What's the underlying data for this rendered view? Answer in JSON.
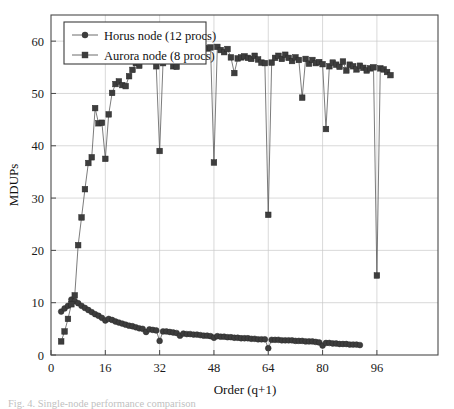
{
  "figure": {
    "caption": "Fig. 4.  Single-node performance comparison",
    "background": "#ffffff"
  },
  "chart_data": {
    "type": "scatter",
    "title": "",
    "xlabel": "Order (q+1)",
    "ylabel": "MDUPs",
    "xlim": [
      0,
      114
    ],
    "ylim": [
      0,
      65
    ],
    "xticks": [
      0,
      16,
      32,
      48,
      64,
      80,
      96
    ],
    "yticks": [
      0,
      10,
      20,
      30,
      40,
      50,
      60
    ],
    "grid": true,
    "legend_position": "top-left",
    "marker_color": "#3d3d3d",
    "line_color": "#5b5b5b",
    "series": [
      {
        "name": "Horus node (12 procs)",
        "marker": "circle",
        "x": [
          3,
          4,
          5,
          6,
          7,
          8,
          9,
          10,
          11,
          12,
          13,
          14,
          15,
          16,
          17,
          18,
          19,
          20,
          21,
          22,
          23,
          24,
          25,
          26,
          27,
          28,
          29,
          30,
          31,
          32,
          33,
          34,
          35,
          36,
          37,
          38,
          39,
          40,
          41,
          42,
          43,
          44,
          45,
          46,
          47,
          48,
          49,
          50,
          51,
          52,
          53,
          54,
          55,
          56,
          57,
          58,
          59,
          60,
          61,
          62,
          63,
          64,
          65,
          66,
          67,
          68,
          69,
          70,
          71,
          72,
          73,
          74,
          75,
          76,
          77,
          78,
          79,
          80,
          81,
          82,
          83,
          84,
          85,
          86,
          87,
          88,
          89,
          90,
          91
        ],
        "y": [
          8.3,
          8.9,
          9.4,
          10.6,
          10.3,
          9.9,
          9.4,
          9.0,
          8.6,
          8.2,
          7.8,
          7.5,
          7.1,
          6.6,
          6.9,
          6.7,
          6.4,
          6.2,
          6.0,
          5.8,
          5.6,
          5.5,
          5.3,
          5.1,
          5.0,
          4.4,
          4.9,
          4.8,
          4.7,
          2.7,
          4.5,
          4.5,
          4.4,
          4.3,
          4.2,
          3.7,
          4.1,
          4.0,
          4.0,
          3.9,
          3.9,
          3.8,
          3.7,
          3.7,
          3.6,
          3.3,
          3.6,
          3.5,
          3.5,
          3.4,
          3.4,
          3.3,
          3.3,
          3.2,
          3.2,
          3.2,
          3.1,
          3.1,
          3.0,
          3.0,
          3.0,
          1.3,
          2.9,
          2.9,
          2.9,
          2.8,
          2.8,
          2.8,
          2.8,
          2.7,
          2.7,
          2.7,
          2.6,
          2.6,
          2.6,
          2.5,
          2.4,
          1.8,
          2.3,
          2.3,
          2.2,
          2.2,
          2.1,
          2.1,
          2.1,
          2.0,
          2.0,
          2.0,
          1.9
        ]
      },
      {
        "name": "Aurora node (8 procs)",
        "marker": "square",
        "x": [
          3,
          4,
          5,
          6,
          7,
          8,
          9,
          10,
          11,
          12,
          13,
          14,
          15,
          16,
          17,
          18,
          19,
          20,
          21,
          22,
          23,
          24,
          25,
          26,
          27,
          28,
          29,
          30,
          31,
          32,
          33,
          34,
          35,
          36,
          37,
          38,
          39,
          40,
          41,
          42,
          43,
          44,
          45,
          46,
          47,
          48,
          49,
          50,
          51,
          52,
          53,
          54,
          55,
          56,
          57,
          58,
          59,
          60,
          61,
          62,
          63,
          64,
          65,
          66,
          67,
          68,
          69,
          70,
          71,
          72,
          73,
          74,
          75,
          76,
          77,
          78,
          79,
          80,
          81,
          82,
          83,
          84,
          85,
          86,
          87,
          88,
          89,
          90,
          91,
          92,
          93,
          94,
          95,
          96,
          97,
          98,
          99,
          100
        ],
        "y": [
          2.6,
          4.5,
          6.9,
          9.7,
          11.4,
          21.0,
          26.3,
          31.7,
          36.7,
          37.8,
          47.2,
          44.3,
          44.4,
          37.5,
          46.0,
          50.1,
          51.8,
          52.3,
          51.6,
          51.4,
          53.3,
          54.5,
          55.8,
          55.3,
          56.3,
          57.0,
          57.6,
          57.9,
          55.2,
          39.0,
          55.8,
          56.5,
          57.4,
          55.2,
          55.1,
          57.4,
          58.6,
          58.9,
          59.5,
          58.8,
          59.4,
          58.6,
          58.7,
          58.6,
          58.8,
          36.8,
          58.9,
          58.3,
          57.9,
          58.5,
          56.9,
          53.9,
          56.7,
          56.9,
          57.1,
          56.8,
          56.6,
          57.2,
          56.5,
          55.9,
          55.8,
          26.8,
          55.9,
          56.8,
          57.2,
          56.6,
          57.4,
          56.8,
          56.2,
          56.9,
          56.4,
          49.2,
          56.6,
          55.7,
          56.4,
          55.8,
          56.0,
          55.6,
          43.2,
          55.2,
          55.9,
          55.5,
          55.1,
          56.1,
          54.4,
          55.5,
          55.2,
          54.6,
          55.3,
          54.9,
          54.4,
          54.8,
          55.0,
          15.2,
          54.8,
          54.6,
          54.1,
          53.5
        ]
      }
    ]
  },
  "legend": {
    "entries": [
      {
        "label": "Horus node (12 procs)",
        "marker": "circle"
      },
      {
        "label": "Aurora node (8 procs)",
        "marker": "square"
      }
    ]
  },
  "axis": {
    "x_title": "Order (q+1)",
    "y_title": "MDUPs",
    "x_tick_labels": [
      "0",
      "16",
      "32",
      "48",
      "64",
      "80",
      "96"
    ],
    "y_tick_labels": [
      "0",
      "10",
      "20",
      "30",
      "40",
      "50",
      "60"
    ]
  }
}
